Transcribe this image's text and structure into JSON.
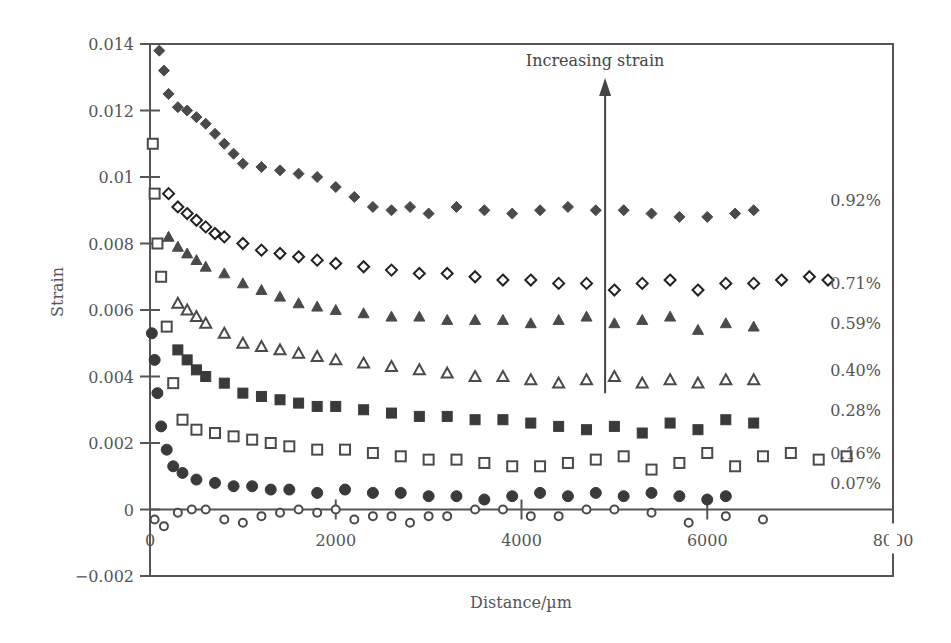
{
  "chart_data": {
    "type": "scatter",
    "title": "",
    "xlabel": "Distance/µm",
    "ylabel": "Strain",
    "xlim": [
      0,
      8000
    ],
    "ylim": [
      -0.002,
      0.014
    ],
    "x_ticks": [
      0,
      2000,
      4000,
      6000,
      8000
    ],
    "x_tick_labels": [
      "0",
      "2000",
      "4000",
      "6000",
      "8000"
    ],
    "y_ticks": [
      -0.002,
      0,
      0.002,
      0.004,
      0.006,
      0.008,
      0.01,
      0.012,
      0.014
    ],
    "y_tick_labels": [
      "−0.002",
      "0",
      "0.002",
      "0.004",
      "0.006",
      "0.008",
      "0.01",
      "0.012",
      "0.014"
    ],
    "grid": false,
    "legend_position": "inline-right",
    "annotation": {
      "text": "Increasing strain",
      "arrow_x": 4900,
      "arrow_from_y": 0.0035,
      "arrow_to_y": 0.0128
    },
    "series": [
      {
        "name": "0.92%",
        "marker": "diamond-filled",
        "color": "#4a4a4a",
        "x": [
          100,
          150,
          200,
          300,
          400,
          500,
          600,
          700,
          800,
          900,
          1000,
          1200,
          1400,
          1600,
          1800,
          2000,
          2200,
          2400,
          2600,
          2800,
          3000,
          3300,
          3600,
          3900,
          4200,
          4500,
          4800,
          5100,
          5400,
          5700,
          6000,
          6300,
          6500
        ],
        "y": [
          0.0138,
          0.0132,
          0.0125,
          0.0121,
          0.012,
          0.0118,
          0.0116,
          0.0113,
          0.011,
          0.0107,
          0.0104,
          0.0103,
          0.0102,
          0.0101,
          0.01,
          0.0097,
          0.0094,
          0.0091,
          0.009,
          0.0091,
          0.0089,
          0.0091,
          0.009,
          0.0089,
          0.009,
          0.0091,
          0.009,
          0.009,
          0.0089,
          0.0088,
          0.0088,
          0.0089,
          0.009
        ]
      },
      {
        "name": "0.71%",
        "marker": "diamond-open",
        "color": "#222222",
        "x": [
          200,
          300,
          400,
          500,
          600,
          700,
          800,
          1000,
          1200,
          1400,
          1600,
          1800,
          2000,
          2300,
          2600,
          2900,
          3200,
          3500,
          3800,
          4100,
          4400,
          4700,
          5000,
          5300,
          5600,
          5900,
          6200,
          6500,
          6800,
          7100,
          7300
        ],
        "y": [
          0.0095,
          0.0091,
          0.0089,
          0.0087,
          0.0085,
          0.0083,
          0.0082,
          0.008,
          0.0078,
          0.0077,
          0.0076,
          0.0075,
          0.0074,
          0.0073,
          0.0072,
          0.0071,
          0.0071,
          0.007,
          0.0069,
          0.0069,
          0.0068,
          0.0068,
          0.0066,
          0.0068,
          0.0069,
          0.0066,
          0.0068,
          0.0068,
          0.0069,
          0.007,
          0.0069
        ]
      },
      {
        "name": "0.59%",
        "marker": "triangle-filled",
        "color": "#4a4a4a",
        "x": [
          200,
          300,
          400,
          500,
          600,
          800,
          1000,
          1200,
          1400,
          1600,
          1800,
          2000,
          2300,
          2600,
          2900,
          3200,
          3500,
          3800,
          4100,
          4400,
          4700,
          5000,
          5300,
          5600,
          5900,
          6200,
          6500
        ],
        "y": [
          0.0082,
          0.0079,
          0.0077,
          0.0075,
          0.0073,
          0.0071,
          0.0068,
          0.0066,
          0.0064,
          0.0062,
          0.0061,
          0.006,
          0.0059,
          0.0058,
          0.0058,
          0.0057,
          0.0057,
          0.0057,
          0.0056,
          0.0057,
          0.0058,
          0.0056,
          0.0057,
          0.0058,
          0.0054,
          0.0056,
          0.0055
        ]
      },
      {
        "name": "0.40%",
        "marker": "triangle-open",
        "color": "#4a4a4a",
        "x": [
          300,
          400,
          500,
          600,
          800,
          1000,
          1200,
          1400,
          1600,
          1800,
          2000,
          2300,
          2600,
          2900,
          3200,
          3500,
          3800,
          4100,
          4400,
          4700,
          5000,
          5300,
          5600,
          5900,
          6200,
          6500
        ],
        "y": [
          0.0062,
          0.006,
          0.0058,
          0.0056,
          0.0053,
          0.005,
          0.0049,
          0.0048,
          0.0047,
          0.0046,
          0.0045,
          0.0044,
          0.0043,
          0.0042,
          0.0041,
          0.004,
          0.004,
          0.0039,
          0.0038,
          0.0039,
          0.004,
          0.0038,
          0.0039,
          0.0038,
          0.0039,
          0.0039
        ]
      },
      {
        "name": "0.28%",
        "marker": "square-filled",
        "color": "#3a3a3a",
        "x": [
          300,
          400,
          500,
          600,
          800,
          1000,
          1200,
          1400,
          1600,
          1800,
          2000,
          2300,
          2600,
          2900,
          3200,
          3500,
          3800,
          4100,
          4400,
          4700,
          5000,
          5300,
          5600,
          5900,
          6200,
          6500
        ],
        "y": [
          0.0048,
          0.0045,
          0.0042,
          0.004,
          0.0038,
          0.0035,
          0.0034,
          0.0033,
          0.0032,
          0.0031,
          0.0031,
          0.003,
          0.0029,
          0.0028,
          0.0028,
          0.0027,
          0.0027,
          0.0026,
          0.0025,
          0.0024,
          0.0025,
          0.0023,
          0.0026,
          0.0024,
          0.0027,
          0.0026
        ]
      },
      {
        "name": "0.16%",
        "marker": "square-open",
        "color": "#4a4a4a",
        "x": [
          30,
          50,
          80,
          120,
          180,
          250,
          350,
          500,
          700,
          900,
          1100,
          1300,
          1500,
          1800,
          2100,
          2400,
          2700,
          3000,
          3300,
          3600,
          3900,
          4200,
          4500,
          4800,
          5100,
          5400,
          5700,
          6000,
          6300,
          6600,
          6900,
          7200,
          7500
        ],
        "y": [
          0.011,
          0.0095,
          0.008,
          0.007,
          0.0055,
          0.0038,
          0.0027,
          0.0024,
          0.0023,
          0.0022,
          0.0021,
          0.002,
          0.0019,
          0.0018,
          0.0018,
          0.0017,
          0.0016,
          0.0015,
          0.0015,
          0.0014,
          0.0013,
          0.0013,
          0.0014,
          0.0015,
          0.0016,
          0.0012,
          0.0014,
          0.0017,
          0.0013,
          0.0016,
          0.0017,
          0.0015,
          0.0016
        ]
      },
      {
        "name": "0.07%",
        "marker": "circle-filled",
        "color": "#3a3a3a",
        "x": [
          20,
          50,
          80,
          120,
          180,
          250,
          350,
          500,
          700,
          900,
          1100,
          1300,
          1500,
          1800,
          2100,
          2400,
          2700,
          3000,
          3300,
          3600,
          3900,
          4200,
          4500,
          4800,
          5100,
          5400,
          5700,
          6000,
          6200
        ],
        "y": [
          0.0053,
          0.0045,
          0.0035,
          0.0025,
          0.0018,
          0.0013,
          0.0011,
          0.0009,
          0.0008,
          0.0007,
          0.0007,
          0.0006,
          0.0006,
          0.0005,
          0.0006,
          0.0005,
          0.0005,
          0.0004,
          0.0004,
          0.0003,
          0.0004,
          0.0005,
          0.0004,
          0.0005,
          0.0004,
          0.0005,
          0.0004,
          0.0003,
          0.0004
        ]
      },
      {
        "name": "baseline",
        "marker": "circle-open",
        "color": "#4a4a4a",
        "x": [
          50,
          150,
          300,
          450,
          600,
          800,
          1000,
          1200,
          1400,
          1600,
          1800,
          2000,
          2200,
          2400,
          2600,
          2800,
          3000,
          3200,
          3500,
          3800,
          4100,
          4400,
          4700,
          5000,
          5400,
          5800,
          6200,
          6600
        ],
        "y": [
          -0.0003,
          -0.0005,
          -0.0001,
          0.0,
          0.0,
          -0.0003,
          -0.0004,
          -0.0002,
          -0.0001,
          0.0,
          -0.0001,
          0.0,
          -0.0003,
          -0.0002,
          -0.0002,
          -0.0004,
          -0.0002,
          -0.0002,
          0.0,
          0.0,
          -0.0002,
          -0.0002,
          0.0,
          0.0,
          -0.0001,
          -0.0004,
          -0.0002,
          -0.0003
        ]
      }
    ],
    "series_labels": [
      {
        "text": "0.92%",
        "y": 0.0093
      },
      {
        "text": "0.71%",
        "y": 0.0068
      },
      {
        "text": "0.59%",
        "y": 0.0056
      },
      {
        "text": "0.40%",
        "y": 0.0042
      },
      {
        "text": "0.28%",
        "y": 0.003
      },
      {
        "text": "0.16%",
        "y": 0.0017
      },
      {
        "text": "0.07%",
        "y": 0.0008
      }
    ]
  },
  "layout": {
    "plot_left": 150,
    "plot_right": 893,
    "plot_top": 44,
    "plot_bottom": 576
  }
}
